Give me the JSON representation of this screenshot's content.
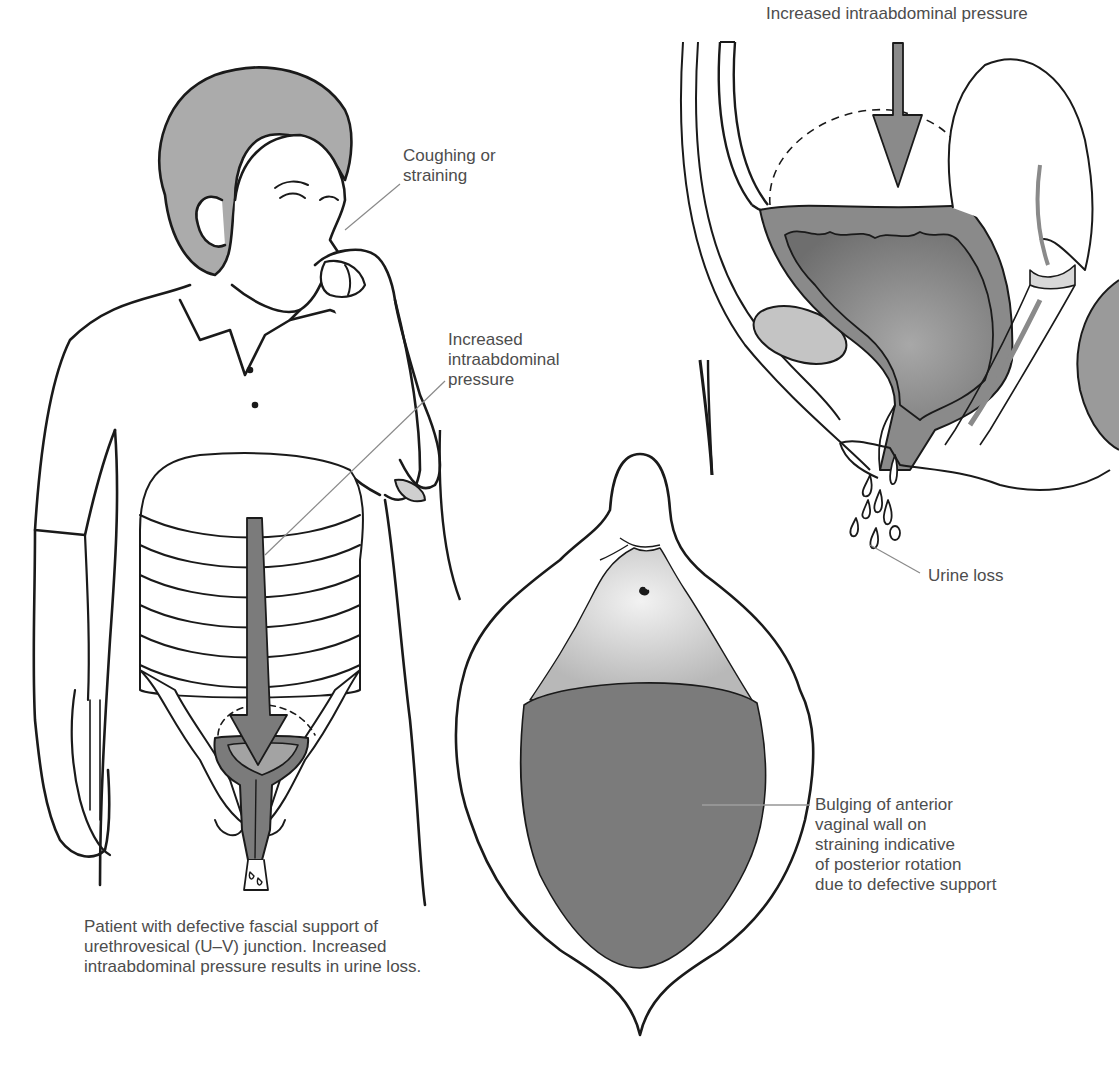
{
  "figure": {
    "panels": {
      "patient": {
        "labels": {
          "coughing": [
            "Coughing or",
            "straining"
          ],
          "pressure": [
            "Increased",
            "intraabdominal",
            "pressure"
          ]
        },
        "caption": [
          "Patient with defective fascial support of",
          "urethrovesical (U–V) junction. Increased",
          "intraabdominal pressure results in urine loss."
        ]
      },
      "sagittal_section": {
        "labels": {
          "pressure": "Increased intraabdominal pressure",
          "urine_loss": "Urine loss"
        }
      },
      "vaginal_view": {
        "labels": {
          "bulging": [
            "Bulging of anterior",
            "vaginal wall on",
            "straining indicative",
            "of posterior rotation",
            "due to defective support"
          ]
        }
      }
    },
    "colors": {
      "line": "#1a1a1a",
      "leader": "#8a8a8a",
      "dark_fill": "#7b7b7b",
      "mid_fill": "#9a9a9a",
      "light_fill": "#c4c4c4",
      "hair_fill": "#ababab",
      "text": "#4d4d4d"
    }
  }
}
